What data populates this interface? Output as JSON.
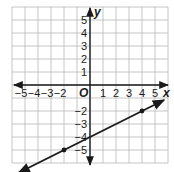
{
  "chart_data": {
    "type": "line",
    "title": "",
    "xlabel": "x",
    "ylabel": "y",
    "origin_label": "O",
    "xlim": [
      -6,
      6
    ],
    "ylim": [
      -6,
      6
    ],
    "grid": true,
    "x_tick_labels": [
      "-5",
      "-4",
      "-3",
      "-2",
      "1",
      "2",
      "3",
      "4",
      "5"
    ],
    "y_tick_labels": [
      "5",
      "4",
      "3",
      "2",
      "1",
      "-2",
      "-3",
      "-4",
      "-5"
    ],
    "series": [
      {
        "name": "line",
        "equation": "y = 0.5x - 4",
        "slope": 0.5,
        "intercept": -4,
        "marked_points": [
          [
            -2,
            -5
          ],
          [
            4,
            -2
          ]
        ],
        "x_range": [
          -5.5,
          5.7
        ]
      }
    ],
    "colors": {
      "grid": "#b8b8b8",
      "axis": "#1a1a1a",
      "line": "#1a1a1a"
    }
  }
}
